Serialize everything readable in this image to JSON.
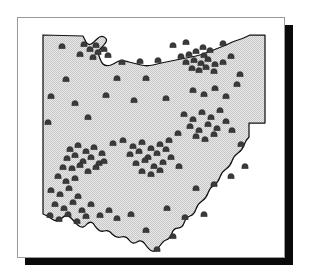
{
  "figure": {
    "type": "distribution-map",
    "region_name": "Ohio",
    "frame_color": "#9a9a9a",
    "shadow_color": "#0a0a0a",
    "state_fill_color": "#d8d8d8",
    "state_outline_color": "#111111",
    "marker_color": "#3a3a3a",
    "marker_symbol": "mound-marker",
    "marker_count": 123,
    "background_color": "#ffffff"
  },
  "chart_data": {
    "type": "scatter",
    "title": "",
    "xlabel": "",
    "ylabel": "",
    "projection": "outline-map",
    "region": "Ohio",
    "grid": false,
    "legend": null,
    "symbol": "mound-marker",
    "xlim": [
      0,
      268
    ],
    "ylim": [
      0,
      241
    ],
    "clusters": [
      {
        "name": "southwest-cluster",
        "approx_center": [
          72,
          148
        ],
        "count": 39
      },
      {
        "name": "central-cluster",
        "approx_center": [
          128,
          138
        ],
        "count": 22
      },
      {
        "name": "northeast-cluster",
        "approx_center": [
          180,
          73
        ],
        "count": 18
      },
      {
        "name": "east-central-cluster",
        "approx_center": [
          188,
          113
        ],
        "count": 15
      },
      {
        "name": "north-cluster",
        "approx_center": [
          75,
          30
        ],
        "count": 9
      }
    ],
    "points": [
      [
        44,
        28
      ],
      [
        66,
        26
      ],
      [
        72,
        31
      ],
      [
        78,
        27
      ],
      [
        80,
        34
      ],
      [
        86,
        31
      ],
      [
        90,
        37
      ],
      [
        75,
        39
      ],
      [
        62,
        36
      ],
      [
        104,
        44
      ],
      [
        122,
        43
      ],
      [
        140,
        42
      ],
      [
        48,
        61
      ],
      [
        99,
        60
      ],
      [
        128,
        60
      ],
      [
        155,
        27
      ],
      [
        168,
        24
      ],
      [
        185,
        29
      ],
      [
        205,
        25
      ],
      [
        163,
        38
      ],
      [
        171,
        36
      ],
      [
        178,
        33
      ],
      [
        186,
        37
      ],
      [
        192,
        32
      ],
      [
        168,
        44
      ],
      [
        176,
        42
      ],
      [
        183,
        45
      ],
      [
        190,
        41
      ],
      [
        197,
        46
      ],
      [
        174,
        50
      ],
      [
        181,
        52
      ],
      [
        188,
        49
      ],
      [
        196,
        53
      ],
      [
        205,
        44
      ],
      [
        213,
        38
      ],
      [
        222,
        56
      ],
      [
        33,
        78
      ],
      [
        57,
        85
      ],
      [
        88,
        77
      ],
      [
        116,
        82
      ],
      [
        148,
        80
      ],
      [
        175,
        72
      ],
      [
        186,
        76
      ],
      [
        197,
        70
      ],
      [
        208,
        78
      ],
      [
        219,
        66
      ],
      [
        30,
        104
      ],
      [
        70,
        99
      ],
      [
        166,
        96
      ],
      [
        175,
        101
      ],
      [
        184,
        94
      ],
      [
        193,
        99
      ],
      [
        202,
        92
      ],
      [
        172,
        108
      ],
      [
        181,
        112
      ],
      [
        190,
        106
      ],
      [
        199,
        110
      ],
      [
        208,
        103
      ],
      [
        178,
        118
      ],
      [
        187,
        121
      ],
      [
        196,
        116
      ],
      [
        214,
        112
      ],
      [
        151,
        122
      ],
      [
        160,
        115
      ],
      [
        223,
        126
      ],
      [
        95,
        125
      ],
      [
        105,
        122
      ],
      [
        115,
        128
      ],
      [
        124,
        124
      ],
      [
        133,
        130
      ],
      [
        142,
        126
      ],
      [
        112,
        136
      ],
      [
        121,
        133
      ],
      [
        130,
        139
      ],
      [
        139,
        135
      ],
      [
        148,
        131
      ],
      [
        118,
        145
      ],
      [
        127,
        142
      ],
      [
        136,
        148
      ],
      [
        145,
        144
      ],
      [
        124,
        153
      ],
      [
        133,
        156
      ],
      [
        142,
        152
      ],
      [
        153,
        139
      ],
      [
        161,
        148
      ],
      [
        52,
        131
      ],
      [
        60,
        127
      ],
      [
        68,
        133
      ],
      [
        76,
        129
      ],
      [
        84,
        135
      ],
      [
        49,
        140
      ],
      [
        57,
        137
      ],
      [
        65,
        143
      ],
      [
        73,
        139
      ],
      [
        81,
        145
      ],
      [
        54,
        150
      ],
      [
        62,
        147
      ],
      [
        70,
        153
      ],
      [
        78,
        149
      ],
      [
        86,
        143
      ],
      [
        45,
        149
      ],
      [
        40,
        158
      ],
      [
        48,
        163
      ],
      [
        57,
        160
      ],
      [
        33,
        172
      ],
      [
        42,
        176
      ],
      [
        51,
        170
      ],
      [
        60,
        178
      ],
      [
        37,
        186
      ],
      [
        46,
        190
      ],
      [
        55,
        184
      ],
      [
        64,
        192
      ],
      [
        73,
        186
      ],
      [
        32,
        197
      ],
      [
        41,
        201
      ],
      [
        50,
        196
      ],
      [
        59,
        203
      ],
      [
        68,
        198
      ],
      [
        82,
        197
      ],
      [
        91,
        192
      ],
      [
        99,
        200
      ],
      [
        113,
        196
      ],
      [
        149,
        190
      ],
      [
        178,
        170
      ],
      [
        196,
        166
      ],
      [
        213,
        158
      ],
      [
        227,
        148
      ],
      [
        167,
        199
      ],
      [
        186,
        196
      ],
      [
        128,
        212
      ],
      [
        155,
        218
      ],
      [
        139,
        231
      ]
    ]
  }
}
